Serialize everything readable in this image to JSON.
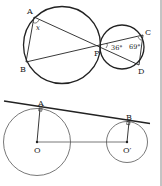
{
  "figures": [
    {
      "name": "two-tangent-circles-at-P",
      "labels": {
        "A": "A",
        "B": "B",
        "P": "P",
        "C": "C",
        "D": "D",
        "angle_x": "x",
        "angle_36": "36°",
        "angle_69": "69°"
      }
    },
    {
      "name": "common-external-tangent",
      "labels": {
        "A": "A",
        "B": "B",
        "O": "O",
        "O_prime": "O′"
      }
    }
  ],
  "colors": {
    "stroke": "#222222",
    "thin_stroke": "#555555",
    "background": "#ffffff",
    "divider": "#888888"
  }
}
